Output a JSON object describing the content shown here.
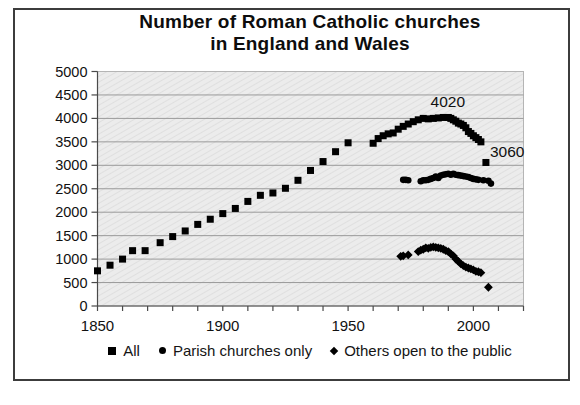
{
  "title": {
    "line1": "Number of Roman Catholic churches",
    "line2": "in England and Wales"
  },
  "colors": {
    "marker": "#000000",
    "gridline": "#9a9a9a",
    "plot_background": "#ececec",
    "plot_hatch_line": "#dfdfdf",
    "axis": "#4a4a4a",
    "frame_border": "#3c3c3c",
    "text": "#111111"
  },
  "chart_data": {
    "type": "scatter",
    "title": "Number of Roman Catholic churches in England and Wales",
    "xlabel": "",
    "ylabel": "",
    "xlim": [
      1850,
      2020
    ],
    "ylim": [
      0,
      5000
    ],
    "ytick_step": 500,
    "yticks": [
      0,
      500,
      1000,
      1500,
      2000,
      2500,
      3000,
      3500,
      4000,
      4500,
      5000
    ],
    "xticks_labeled": [
      1850,
      1900,
      1950,
      2000
    ],
    "xtick_minor_step": 10,
    "grid": "horizontal",
    "legend_position": "bottom",
    "series": [
      {
        "name": "All",
        "marker": "square",
        "points": [
          [
            1850,
            750
          ],
          [
            1855,
            870
          ],
          [
            1860,
            1000
          ],
          [
            1864,
            1180
          ],
          [
            1869,
            1180
          ],
          [
            1875,
            1350
          ],
          [
            1880,
            1480
          ],
          [
            1885,
            1600
          ],
          [
            1890,
            1740
          ],
          [
            1895,
            1850
          ],
          [
            1900,
            1970
          ],
          [
            1905,
            2080
          ],
          [
            1910,
            2230
          ],
          [
            1915,
            2360
          ],
          [
            1920,
            2410
          ],
          [
            1925,
            2510
          ],
          [
            1930,
            2680
          ],
          [
            1935,
            2890
          ],
          [
            1940,
            3080
          ],
          [
            1945,
            3290
          ],
          [
            1950,
            3480
          ],
          [
            1960,
            3470
          ],
          [
            1962,
            3570
          ],
          [
            1964,
            3630
          ],
          [
            1966,
            3670
          ],
          [
            1968,
            3690
          ],
          [
            1970,
            3770
          ],
          [
            1972,
            3830
          ],
          [
            1974,
            3880
          ],
          [
            1976,
            3930
          ],
          [
            1978,
            3970
          ],
          [
            1980,
            4000
          ],
          [
            1982,
            3990
          ],
          [
            1984,
            4000
          ],
          [
            1986,
            4010
          ],
          [
            1988,
            4020
          ],
          [
            1990,
            4020
          ],
          [
            1991,
            4000
          ],
          [
            1992,
            3970
          ],
          [
            1993,
            3940
          ],
          [
            1994,
            3900
          ],
          [
            1995,
            3880
          ],
          [
            1996,
            3850
          ],
          [
            1997,
            3800
          ],
          [
            1998,
            3720
          ],
          [
            1999,
            3680
          ],
          [
            2000,
            3630
          ],
          [
            2001,
            3590
          ],
          [
            2002,
            3550
          ],
          [
            2003,
            3500
          ],
          [
            2005,
            3060
          ]
        ]
      },
      {
        "name": "Parish churches only",
        "marker": "circle",
        "points": [
          [
            1972,
            2690
          ],
          [
            1973,
            2690
          ],
          [
            1974,
            2680
          ],
          [
            1979,
            2660
          ],
          [
            1980,
            2680
          ],
          [
            1981,
            2680
          ],
          [
            1982,
            2690
          ],
          [
            1983,
            2710
          ],
          [
            1984,
            2730
          ],
          [
            1985,
            2760
          ],
          [
            1986,
            2730
          ],
          [
            1987,
            2780
          ],
          [
            1988,
            2800
          ],
          [
            1989,
            2810
          ],
          [
            1990,
            2820
          ],
          [
            1991,
            2800
          ],
          [
            1992,
            2820
          ],
          [
            1993,
            2800
          ],
          [
            1994,
            2790
          ],
          [
            1995,
            2780
          ],
          [
            1996,
            2770
          ],
          [
            1997,
            2760
          ],
          [
            1998,
            2750
          ],
          [
            1999,
            2730
          ],
          [
            2000,
            2710
          ],
          [
            2001,
            2700
          ],
          [
            2002,
            2690
          ],
          [
            2004,
            2680
          ],
          [
            2006,
            2670
          ],
          [
            2007,
            2610
          ]
        ]
      },
      {
        "name": "Others open to the public",
        "marker": "diamond",
        "points": [
          [
            1971,
            1060
          ],
          [
            1972,
            1070
          ],
          [
            1974,
            1090
          ],
          [
            1978,
            1160
          ],
          [
            1979,
            1190
          ],
          [
            1980,
            1210
          ],
          [
            1981,
            1240
          ],
          [
            1982,
            1230
          ],
          [
            1983,
            1250
          ],
          [
            1984,
            1260
          ],
          [
            1985,
            1250
          ],
          [
            1986,
            1240
          ],
          [
            1987,
            1230
          ],
          [
            1988,
            1210
          ],
          [
            1989,
            1180
          ],
          [
            1990,
            1160
          ],
          [
            1991,
            1110
          ],
          [
            1992,
            1070
          ],
          [
            1993,
            1000
          ],
          [
            1994,
            950
          ],
          [
            1995,
            900
          ],
          [
            1996,
            860
          ],
          [
            1997,
            830
          ],
          [
            1998,
            810
          ],
          [
            1999,
            790
          ],
          [
            2000,
            770
          ],
          [
            2001,
            740
          ],
          [
            2002,
            730
          ],
          [
            2003,
            710
          ],
          [
            2006,
            400
          ]
        ]
      }
    ],
    "annotations": [
      {
        "text": "4020",
        "year": 1989,
        "value": 4020,
        "anchor": "middle",
        "dx": 2,
        "dy": -10
      },
      {
        "text": "3060",
        "year": 2005,
        "value": 3060,
        "anchor": "start",
        "dx": 4,
        "dy": -5
      }
    ]
  },
  "legend": [
    {
      "marker": "square"
    },
    {
      "marker": "circle"
    },
    {
      "marker": "diamond"
    }
  ]
}
